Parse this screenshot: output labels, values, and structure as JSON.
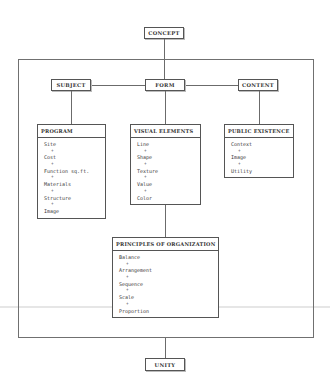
{
  "diagram": {
    "top": {
      "label": "CONCEPT"
    },
    "bottom": {
      "label": "UNITY"
    },
    "categories": [
      {
        "label": "SUBJECT"
      },
      {
        "label": "FORM"
      },
      {
        "label": "CONTENT"
      }
    ],
    "groups": {
      "program": {
        "title": "PROGRAM",
        "items": [
          "Site",
          "Cost",
          "Function sq.ft.",
          "Materials",
          "Structure",
          "Image"
        ]
      },
      "visual_elements": {
        "title": "VISUAL ELEMENTS",
        "items": [
          "Line",
          "Shape",
          "Texture",
          "Value",
          "Color"
        ]
      },
      "public_existence": {
        "title": "PUBLIC EXISTENCE",
        "items": [
          "Context",
          "Image",
          "Utility"
        ]
      },
      "principles": {
        "title": "PRINCIPLES OF ORGANIZATION",
        "items": [
          "Balance",
          "Arrangement",
          "Sequence",
          "Scale",
          "Proportion"
        ]
      }
    },
    "connector_symbol": "+",
    "colors": {
      "line": "#6b6b6b",
      "text": "#333333",
      "background": "#ffffff"
    }
  }
}
